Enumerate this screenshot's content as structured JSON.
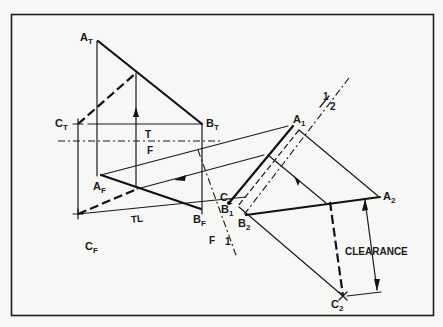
{
  "diagram": {
    "type": "descriptive-geometry-clearance",
    "views": {
      "top": {
        "points": {
          "A": "A",
          "B": "B",
          "C": "C"
        },
        "subscript": "T"
      },
      "front": {
        "points": {
          "A": "A",
          "B": "B",
          "C": "C"
        },
        "subscript": "F"
      },
      "aux1": {
        "points": {
          "A": "A",
          "B": "B",
          "C": "C"
        },
        "subscript": "1"
      },
      "aux2": {
        "points": {
          "A": "A",
          "B": "B",
          "C": "C"
        },
        "subscript": "2"
      }
    },
    "labels": {
      "A_T": {
        "main": "A",
        "sub": "T"
      },
      "B_T": {
        "main": "B",
        "sub": "T"
      },
      "C_T": {
        "main": "C",
        "sub": "T"
      },
      "A_F": {
        "main": "A",
        "sub": "F"
      },
      "B_F": {
        "main": "B",
        "sub": "F"
      },
      "C_F": {
        "main": "C",
        "sub": "F"
      },
      "A_1": {
        "main": "A",
        "sub": "1"
      },
      "B_1": {
        "main": "B",
        "sub": "1"
      },
      "C_1": {
        "main": "C",
        "sub": "1"
      },
      "A_2": {
        "main": "A",
        "sub": "2"
      },
      "B_2": {
        "main": "B",
        "sub": "2"
      },
      "C_2": {
        "main": "C",
        "sub": "2"
      }
    },
    "fold_lines": {
      "tf_top": "T",
      "tf_bottom": "F",
      "f1_left": "F",
      "f1_right": "1",
      "12_top": "1",
      "12_bottom": "2"
    },
    "annotations": {
      "true_length": "TL",
      "clearance": "CLEARANCE"
    }
  }
}
